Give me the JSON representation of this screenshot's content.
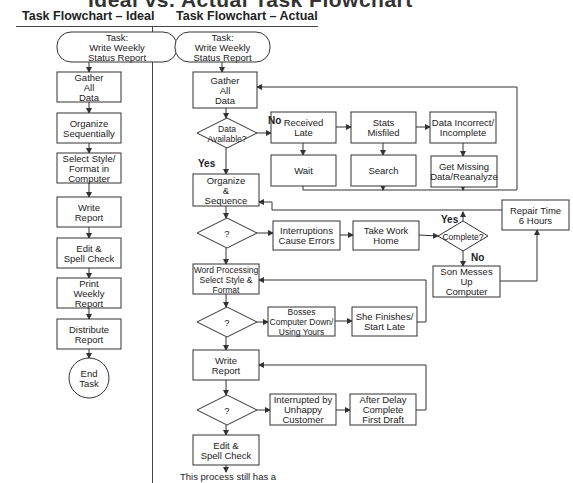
{
  "page_title": "Ideal vs. Actual Task Flowchart",
  "columns": {
    "ideal": {
      "title": "Task Flowchart – Ideal"
    },
    "actual": {
      "title": "Task Flowchart – Actual"
    }
  },
  "ideal_nodes": [
    {
      "id": "i0",
      "type": "terminal",
      "lines": [
        "Task:",
        "Write Weekly",
        "Status Report"
      ]
    },
    {
      "id": "i1",
      "type": "process",
      "lines": [
        "Gather",
        "All",
        "Data"
      ]
    },
    {
      "id": "i2",
      "type": "process",
      "lines": [
        "Organize",
        "Sequentially"
      ]
    },
    {
      "id": "i3",
      "type": "process",
      "lines": [
        "Select Style/",
        "Format in",
        "Computer"
      ]
    },
    {
      "id": "i4",
      "type": "process",
      "lines": [
        "Write",
        "Report"
      ]
    },
    {
      "id": "i5",
      "type": "process",
      "lines": [
        "Edit &",
        "Spell Check"
      ]
    },
    {
      "id": "i6",
      "type": "process",
      "lines": [
        "Print",
        "Weekly",
        "Report"
      ]
    },
    {
      "id": "i7",
      "type": "process",
      "lines": [
        "Distribute",
        "Report"
      ]
    },
    {
      "id": "i8",
      "type": "end",
      "lines": [
        "End",
        "Task"
      ]
    }
  ],
  "actual_nodes": [
    {
      "id": "a0",
      "type": "terminal",
      "lines": [
        "Task:",
        "Write Weekly",
        "Status Report"
      ]
    },
    {
      "id": "a1",
      "type": "process",
      "lines": [
        "Gather",
        "All",
        "Data"
      ]
    },
    {
      "id": "a2",
      "type": "decision",
      "lines": [
        "Data",
        "Available?"
      ]
    },
    {
      "id": "a3",
      "type": "process",
      "lines": [
        "Received",
        "Late"
      ]
    },
    {
      "id": "a4",
      "type": "process",
      "lines": [
        "Stats",
        "Misfiled"
      ]
    },
    {
      "id": "a5",
      "type": "process",
      "lines": [
        "Data Incorrect/",
        "Incomplete"
      ]
    },
    {
      "id": "a6",
      "type": "process",
      "lines": [
        "Wait"
      ]
    },
    {
      "id": "a7",
      "type": "process",
      "lines": [
        "Search"
      ]
    },
    {
      "id": "a8",
      "type": "process",
      "lines": [
        "Get Missing",
        "Data/Reanalyze"
      ]
    },
    {
      "id": "a9",
      "type": "process",
      "lines": [
        "Organize",
        "&",
        "Sequence"
      ]
    },
    {
      "id": "a10",
      "type": "decision",
      "lines": [
        "?"
      ]
    },
    {
      "id": "a11",
      "type": "process",
      "lines": [
        "Interruptions",
        "Cause Errors"
      ]
    },
    {
      "id": "a12",
      "type": "process",
      "lines": [
        "Take Work",
        "Home"
      ]
    },
    {
      "id": "a13",
      "type": "decision",
      "lines": [
        "Complete?"
      ]
    },
    {
      "id": "a14",
      "type": "process",
      "lines": [
        "Repair Time",
        "6 Hours"
      ]
    },
    {
      "id": "a15",
      "type": "process",
      "lines": [
        "Son Messes",
        "Up",
        "Computer"
      ]
    },
    {
      "id": "a16",
      "type": "process",
      "lines": [
        "Word Processing",
        "Select Style &",
        "Format"
      ]
    },
    {
      "id": "a17",
      "type": "decision",
      "lines": [
        "?"
      ]
    },
    {
      "id": "a18",
      "type": "process",
      "lines": [
        "Bosses",
        "Computer Down/",
        "Using Yours"
      ]
    },
    {
      "id": "a19",
      "type": "process",
      "lines": [
        "She Finishes/",
        "Start Late"
      ]
    },
    {
      "id": "a20",
      "type": "process",
      "lines": [
        "Write",
        "Report"
      ]
    },
    {
      "id": "a21",
      "type": "decision",
      "lines": [
        "?"
      ]
    },
    {
      "id": "a22",
      "type": "process",
      "lines": [
        "Interrupted by",
        "Unhappy",
        "Customer"
      ]
    },
    {
      "id": "a23",
      "type": "process",
      "lines": [
        "After Delay",
        "Complete",
        "First Draft"
      ]
    },
    {
      "id": "a24",
      "type": "process",
      "lines": [
        "Edit &",
        "Spell Check"
      ]
    }
  ],
  "edge_labels": {
    "data_no": "No",
    "data_yes": "Yes",
    "complete_yes": "Yes",
    "complete_no": "No"
  },
  "footnote": "This process still has a"
}
